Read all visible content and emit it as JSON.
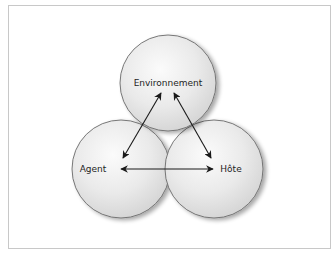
{
  "diagram": {
    "type": "venn-relationship",
    "nodes": [
      {
        "id": "environnement",
        "label": "Environnement",
        "cx": 168,
        "cy": 83,
        "r": 48
      },
      {
        "id": "agent",
        "label": "Agent",
        "cx": 121,
        "cy": 169,
        "r": 49
      },
      {
        "id": "hote",
        "label": "Hôte",
        "cx": 214,
        "cy": 169,
        "r": 49
      }
    ],
    "edges": [
      {
        "from": "environnement",
        "to": "agent",
        "bidirectional": true
      },
      {
        "from": "environnement",
        "to": "hote",
        "bidirectional": true
      },
      {
        "from": "agent",
        "to": "hote",
        "bidirectional": true
      }
    ],
    "colors": {
      "circle_fill_light": "#f4f4f4",
      "circle_fill_dark": "#d6d6d6",
      "circle_stroke": "#6a6a6a",
      "arrow": "#1a1a1a",
      "frame_border": "#c8c8c8",
      "background": "#ffffff"
    }
  }
}
